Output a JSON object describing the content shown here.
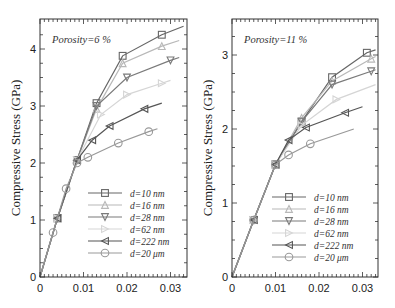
{
  "chart_data": [
    {
      "type": "line",
      "title": "",
      "annotation": "Porosity=6 %",
      "xlabel": "",
      "ylabel": "Compressive Stress (GPa)",
      "xlim": [
        0,
        0.033
      ],
      "ylim": [
        0,
        4.4
      ],
      "xticks": [
        "0",
        "0.01",
        "0.02",
        "0.03"
      ],
      "yticks": [
        "0",
        "1",
        "2",
        "3",
        "4"
      ],
      "grid": false,
      "legend_position": "lower right",
      "series": [
        {
          "name": "d=10 nm",
          "marker": "square",
          "color": "#666666",
          "x": [
            0,
            0.004,
            0.0085,
            0.013,
            0.019,
            0.028,
            0.033
          ],
          "y": [
            0,
            1.03,
            2.05,
            3.05,
            3.88,
            4.25,
            4.4
          ]
        },
        {
          "name": "d=16 nm",
          "marker": "triangle-up",
          "color": "#b8b8b8",
          "x": [
            0,
            0.004,
            0.0085,
            0.013,
            0.019,
            0.028,
            0.032
          ],
          "y": [
            0,
            1.03,
            2.05,
            2.95,
            3.75,
            4.05,
            4.15
          ]
        },
        {
          "name": "d=28 nm",
          "marker": "triangle-down",
          "color": "#7a7a7a",
          "x": [
            0,
            0.004,
            0.0085,
            0.013,
            0.02,
            0.03,
            0.032
          ],
          "y": [
            0,
            1.03,
            2.05,
            3.0,
            3.5,
            3.8,
            3.85
          ]
        },
        {
          "name": "d=62 nm",
          "marker": "triangle-right",
          "color": "#d5d5d5",
          "x": [
            0,
            0.004,
            0.0085,
            0.014,
            0.02,
            0.028,
            0.03
          ],
          "y": [
            0,
            1.03,
            2.05,
            2.85,
            3.2,
            3.4,
            3.45
          ]
        },
        {
          "name": "d=222 nm",
          "marker": "triangle-left",
          "color": "#555555",
          "x": [
            0,
            0.004,
            0.0085,
            0.012,
            0.016,
            0.024,
            0.028
          ],
          "y": [
            0,
            1.03,
            2.05,
            2.4,
            2.65,
            2.95,
            3.05
          ]
        },
        {
          "name": "d=20 μm",
          "marker": "circle",
          "color": "#999999",
          "x": [
            0,
            0.003,
            0.006,
            0.0085,
            0.011,
            0.018,
            0.025,
            0.027
          ],
          "y": [
            0,
            0.78,
            1.55,
            2.0,
            2.1,
            2.35,
            2.55,
            2.6
          ]
        }
      ]
    },
    {
      "type": "line",
      "title": "",
      "annotation": "Porosity=11 %",
      "xlabel": "",
      "ylabel": "Compressive Stress (GPa)",
      "xlim": [
        0,
        0.033
      ],
      "ylim": [
        0,
        3.4
      ],
      "xticks": [
        "0",
        "0.01",
        "0.02",
        "0.03"
      ],
      "yticks": [
        "0",
        "1",
        "2",
        "3"
      ],
      "grid": false,
      "legend_position": "lower right",
      "series": [
        {
          "name": "d=10 nm",
          "marker": "square",
          "color": "#666666",
          "x": [
            0,
            0.005,
            0.01,
            0.016,
            0.023,
            0.031,
            0.033
          ],
          "y": [
            0,
            0.77,
            1.52,
            2.1,
            2.7,
            3.03,
            3.07
          ]
        },
        {
          "name": "d=16 nm",
          "marker": "triangle-up",
          "color": "#b8b8b8",
          "x": [
            0,
            0.005,
            0.01,
            0.016,
            0.023,
            0.032,
            0.033
          ],
          "y": [
            0,
            0.77,
            1.52,
            2.15,
            2.65,
            2.95,
            2.98
          ]
        },
        {
          "name": "d=28 nm",
          "marker": "triangle-down",
          "color": "#7a7a7a",
          "x": [
            0,
            0.005,
            0.01,
            0.016,
            0.023,
            0.032,
            0.033
          ],
          "y": [
            0,
            0.77,
            1.52,
            2.1,
            2.6,
            2.78,
            2.8
          ]
        },
        {
          "name": "d=62 nm",
          "marker": "triangle-right",
          "color": "#d5d5d5",
          "x": [
            0,
            0.005,
            0.01,
            0.016,
            0.024,
            0.033
          ],
          "y": [
            0,
            0.77,
            1.52,
            2.05,
            2.4,
            2.6
          ]
        },
        {
          "name": "d=222 nm",
          "marker": "triangle-left",
          "color": "#555555",
          "x": [
            0,
            0.005,
            0.01,
            0.013,
            0.017,
            0.026,
            0.03
          ],
          "y": [
            0,
            0.77,
            1.52,
            1.85,
            2.02,
            2.22,
            2.3
          ]
        },
        {
          "name": "d=20 μm",
          "marker": "circle",
          "color": "#999999",
          "x": [
            0,
            0.005,
            0.01,
            0.013,
            0.018,
            0.028
          ],
          "y": [
            0,
            0.77,
            1.52,
            1.65,
            1.8,
            2.0
          ]
        }
      ]
    }
  ]
}
